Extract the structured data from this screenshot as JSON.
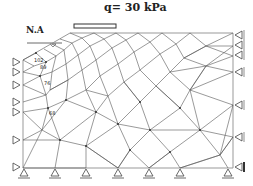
{
  "diagram": {
    "title": "q= 30 kPa",
    "water_level_label": "N.A",
    "node_labels": [
      {
        "text": "102",
        "x": 34,
        "y": 57
      },
      {
        "text": "89",
        "x": 40,
        "y": 64
      },
      {
        "text": "76",
        "x": 44,
        "y": 80
      },
      {
        "text": "68",
        "x": 49,
        "y": 110
      }
    ],
    "colors": {
      "mesh": "#555555",
      "boundary": "#999999",
      "support": "#444444",
      "text": "#222222"
    },
    "load": {
      "x1": 74,
      "x2": 116,
      "y": 26
    },
    "boundary": {
      "left": 23,
      "right": 233,
      "bottom": 168,
      "top": 33
    },
    "supports": {
      "left_rollers_y": [
        62,
        72,
        85,
        102,
        112,
        140,
        167
      ],
      "right_rollers_y": [
        35,
        45,
        55,
        72,
        105,
        137
      ],
      "right_pin_y": 167,
      "bottom_pins_x": [
        24,
        55,
        86,
        118,
        149,
        180,
        228
      ]
    }
  }
}
